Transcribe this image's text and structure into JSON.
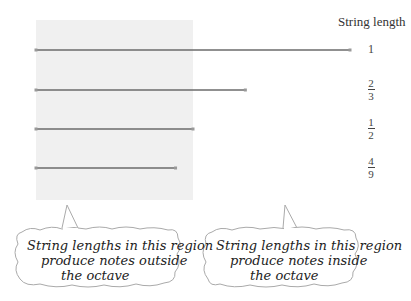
{
  "header": {
    "title": "String length"
  },
  "strings": [
    {
      "label_type": "whole",
      "label": "1",
      "length": 1
    },
    {
      "label_type": "fraction",
      "numerator": "2",
      "denominator": "3",
      "length": 0.6667
    },
    {
      "label_type": "fraction",
      "numerator": "1",
      "denominator": "2",
      "length": 0.5
    },
    {
      "label_type": "fraction",
      "numerator": "4",
      "denominator": "9",
      "length": 0.4444
    }
  ],
  "shaded_region": {
    "from_length": 0,
    "to_length": 0.5
  },
  "callouts": [
    {
      "lines": [
        "String lengths in this region",
        "produce notes outside",
        "the octave"
      ]
    },
    {
      "lines": [
        "String lengths in this region",
        "produce notes inside",
        "the octave"
      ]
    }
  ],
  "colors": {
    "string": "#6b6b6b",
    "shade": "#f0f0f0",
    "callout_border": "#aaaaaa"
  }
}
